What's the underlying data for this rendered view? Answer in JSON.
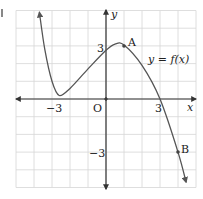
{
  "chart_data": {
    "type": "line",
    "title": "",
    "xlabel": "x",
    "ylabel": "y",
    "xlim": [
      -5,
      5
    ],
    "ylim": [
      -5,
      5
    ],
    "grid": true,
    "grid_step": 1,
    "x_ticks": [
      {
        "value": -3,
        "label": "−3"
      },
      {
        "value": 3,
        "label": "3"
      }
    ],
    "y_ticks": [
      {
        "value": 3,
        "label": "3"
      },
      {
        "value": -3,
        "label": "−3"
      }
    ],
    "origin_label": "O",
    "series": [
      {
        "name": "y = f(x)",
        "x": [
          -3.7,
          -3.4,
          -3.0,
          -2.6,
          -2.0,
          -1.0,
          0.0,
          0.5,
          1.0,
          2.0,
          3.0,
          4.0,
          4.45
        ],
        "y": [
          4.9,
          2.8,
          1.0,
          0.2,
          0.6,
          1.7,
          2.75,
          3.1,
          3.05,
          1.9,
          0.0,
          -3.0,
          -4.7
        ]
      }
    ],
    "points": [
      {
        "name": "A",
        "x": 1,
        "y": 3
      },
      {
        "name": "B",
        "x": 4,
        "y": -3
      }
    ],
    "annotations": [
      {
        "text": "y = f(x)",
        "x": 3.8,
        "y": 2.1
      }
    ]
  },
  "labels": {
    "y_axis": "y",
    "x_axis": "x",
    "origin": "O",
    "tick_x_neg3": "−3",
    "tick_x_3": "3",
    "tick_y_3": "3",
    "tick_y_neg3": "−3",
    "point_a": "A",
    "point_b": "B",
    "curve_label": "y = f(x)"
  },
  "colors": {
    "grid": "#d6d6d6",
    "axis": "#333333",
    "curve": "#555555",
    "point": "#444444"
  }
}
